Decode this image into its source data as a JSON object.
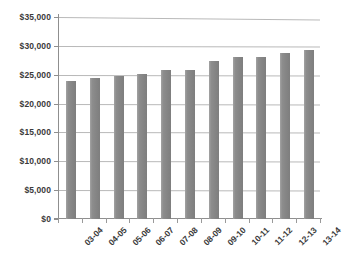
{
  "chart_data": {
    "type": "bar",
    "title": "",
    "subtitle": "",
    "xlabel": "",
    "ylabel": "",
    "categories": [
      "03-04",
      "04-05",
      "05-06",
      "06-07",
      "07-08",
      "08-09",
      "09-10",
      "10-11",
      "11-12",
      "12-13",
      "13-14"
    ],
    "values": [
      23900,
      24500,
      24700,
      25200,
      25800,
      25800,
      27300,
      28000,
      28100,
      28700,
      29200
    ],
    "ylim": [
      0,
      35000
    ],
    "ytick_step": 5000,
    "ytick_labels": [
      "$0",
      "$5,000",
      "$10,000",
      "$15,000",
      "$20,000",
      "$25,000",
      "$30,000",
      "$35,000"
    ],
    "ytick_values": [
      0,
      5000,
      10000,
      15000,
      20000,
      25000,
      30000,
      35000
    ],
    "grid": true,
    "legend": false,
    "legend_position": "none",
    "series": [
      {
        "name": "",
        "values": [
          23900,
          24500,
          24700,
          25200,
          25800,
          25800,
          27300,
          28000,
          28100,
          28700,
          29200
        ]
      }
    ],
    "colors": {
      "bar": "#8a8a8a",
      "gridline": "#b9b9b9",
      "axis": "#8f8f8f",
      "text": "#3a3a3a",
      "background": "#ffffff"
    }
  }
}
